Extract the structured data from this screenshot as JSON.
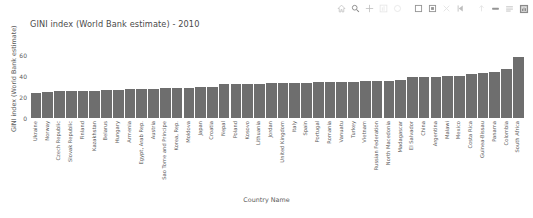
{
  "toolbar": {
    "items": [
      {
        "name": "home-icon",
        "label": "Home"
      },
      {
        "name": "zoom-icon",
        "label": "Zoom"
      },
      {
        "name": "pan-move-icon",
        "label": "Pan"
      },
      {
        "name": "chart-bar-icon",
        "label": "Chart"
      },
      {
        "name": "circle-icon",
        "label": "Circle"
      },
      {
        "name": "square-icon",
        "label": "Rectangle"
      },
      {
        "name": "crop-icon",
        "label": "Crop"
      },
      {
        "name": "close-x-icon",
        "label": "Close"
      },
      {
        "name": "previous-icon",
        "label": "Previous"
      },
      {
        "name": "arrow-up-icon",
        "label": "Up"
      },
      {
        "name": "minus-bar-icon",
        "label": "Minus"
      },
      {
        "name": "list-lines-icon",
        "label": "List"
      },
      {
        "name": "save-image-icon",
        "label": "Save"
      }
    ]
  },
  "chart_data": {
    "type": "bar",
    "title": "GINI index (World Bank estimate) - 2010",
    "xlabel": "Country Name",
    "ylabel": "GINI index (World Bank estimate)",
    "ylim": [
      0,
      70
    ],
    "yticks": [
      0,
      20,
      40,
      60
    ],
    "grid": false,
    "legend": null,
    "bar_color": "#6e6e6e",
    "categories": [
      "Ukraine",
      "Norway",
      "Czech Republic",
      "Slovak Republic",
      "Finland",
      "Kazakhstan",
      "Belarus",
      "Hungary",
      "Armenia",
      "Egypt, Arab Rep.",
      "Austria",
      "Sao Tome and Principe",
      "Korea, Rep.",
      "Moldova",
      "Japan",
      "Croatia",
      "Nepal",
      "Poland",
      "Kosovo",
      "Lithuania",
      "Jordan",
      "United Kingdom",
      "Italy",
      "Spain",
      "Portugal",
      "Romania",
      "Vanuatu",
      "Turkey",
      "Vietnam",
      "Russian Federation",
      "North Macedonia",
      "Madagascar",
      "El Salvador",
      "China",
      "Argentina",
      "Malawi",
      "Mexico",
      "Costa Rica",
      "Guinea-Bissau",
      "Panama",
      "Colombia",
      "South Africa"
    ],
    "values": [
      24.1,
      24.3,
      25.1,
      25.3,
      25.7,
      26.0,
      26.2,
      26.4,
      27.0,
      27.3,
      27.6,
      28.0,
      28.3,
      28.6,
      29.0,
      29.3,
      32.0,
      32.2,
      32.4,
      32.6,
      32.8,
      33.0,
      33.2,
      33.4,
      33.6,
      33.9,
      34.2,
      34.5,
      34.8,
      35.1,
      35.4,
      35.7,
      38.6,
      38.9,
      39.2,
      39.6,
      40.2,
      41.4,
      42.7,
      44.0,
      46.0,
      57.5
    ]
  }
}
